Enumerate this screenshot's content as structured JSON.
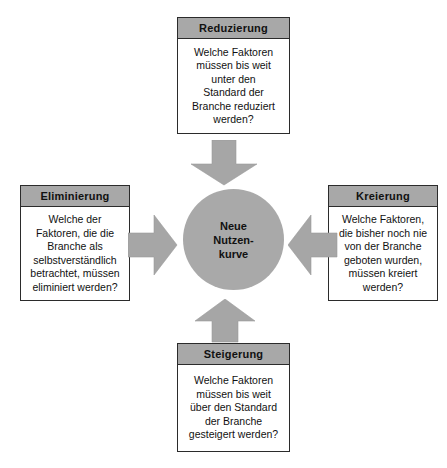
{
  "diagram": {
    "title_center": [
      "Neue",
      "Nutzen-",
      "kurve"
    ],
    "colors": {
      "header_fill": "#a8a8a8",
      "circle_fill": "#a9a9a9",
      "arrow_fill": "#a6a6a6",
      "border": "#2b2b2b",
      "background": "#ffffff",
      "text": "#111111"
    },
    "boxes": [
      {
        "id": "reduzierung",
        "title": "Reduzierung",
        "lines": [
          "Welche Faktoren",
          "müssen bis weit",
          "unter den",
          "Standard der",
          "Branche reduziert",
          "werden?"
        ]
      },
      {
        "id": "eliminierung",
        "title": "Eliminierung",
        "lines": [
          "Welche der",
          "Faktoren, die die",
          "Branche als",
          "selbstverständlich",
          "betrachtet, müssen",
          "eliminiert werden?"
        ]
      },
      {
        "id": "kreierung",
        "title": "Kreierung",
        "lines": [
          "Welche Faktoren,",
          "die bisher noch nie",
          "von der Branche",
          "geboten wurden,",
          "müssen kreiert",
          "werden?"
        ]
      },
      {
        "id": "steigerung",
        "title": "Steigerung",
        "lines": [
          "Welche Faktoren",
          "müssen bis weit",
          "über den Standard",
          "der Branche",
          "gesteigert werden?"
        ]
      }
    ],
    "arrows": [
      {
        "id": "arrow-down",
        "direction": "down",
        "from": "reduzierung",
        "to": "center"
      },
      {
        "id": "arrow-right",
        "direction": "right",
        "from": "eliminierung",
        "to": "center"
      },
      {
        "id": "arrow-left",
        "direction": "left",
        "from": "kreierung",
        "to": "center"
      },
      {
        "id": "arrow-up",
        "direction": "up",
        "from": "steigerung",
        "to": "center"
      }
    ]
  }
}
